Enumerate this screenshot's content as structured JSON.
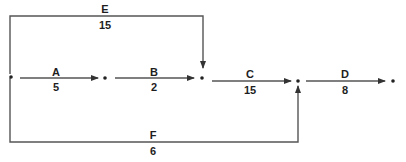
{
  "diagram": {
    "type": "activity-on-arrow network",
    "colors": {
      "line": "#555555",
      "text": "#1e1e1e",
      "node": "#222222",
      "background": "#ffffff"
    },
    "nodes": [
      {
        "id": 1,
        "x": 11,
        "y": 76
      },
      {
        "id": 2,
        "x": 105,
        "y": 76
      },
      {
        "id": 3,
        "x": 202,
        "y": 76
      },
      {
        "id": 4,
        "x": 298,
        "y": 76
      },
      {
        "id": 5,
        "x": 393,
        "y": 76
      }
    ],
    "activities": [
      {
        "name": "A",
        "duration": "5",
        "from": 1,
        "to": 2
      },
      {
        "name": "B",
        "duration": "2",
        "from": 2,
        "to": 3
      },
      {
        "name": "C",
        "duration": "15",
        "from": 3,
        "to": 4
      },
      {
        "name": "D",
        "duration": "8",
        "from": 4,
        "to": 5
      },
      {
        "name": "E",
        "duration": "15",
        "from": 1,
        "to": 3
      },
      {
        "name": "F",
        "duration": "6",
        "from": 1,
        "to": 4
      }
    ]
  }
}
